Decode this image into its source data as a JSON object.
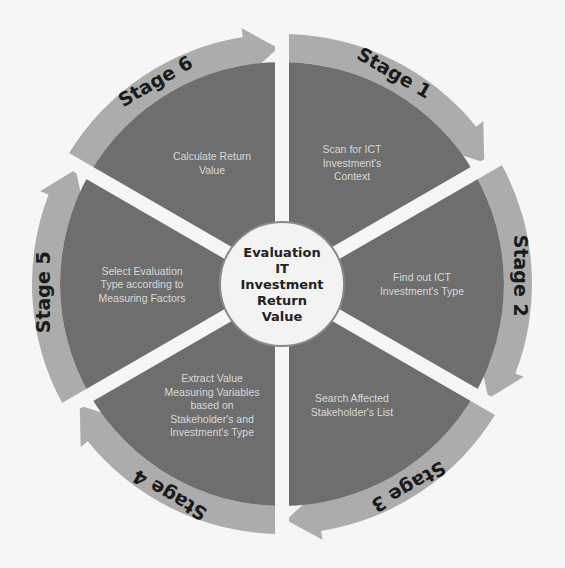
{
  "diagram": {
    "center": {
      "lines": [
        "Evaluation",
        "IT",
        "Investment",
        "Return",
        "Value"
      ]
    },
    "stages": [
      {
        "label": "Stage 1",
        "lines": [
          "Scan for ICT",
          "Investment's",
          "Context"
        ]
      },
      {
        "label": "Stage 2",
        "lines": [
          "Find out ICT",
          "Investment's Type"
        ]
      },
      {
        "label": "Stage 3",
        "lines": [
          "Search Affected",
          "Stakeholder's List"
        ]
      },
      {
        "label": "Stage 4",
        "lines": [
          "Extract Value",
          "Measuring Variables",
          "based on",
          "Stakeholder's and",
          "Investment's Type"
        ]
      },
      {
        "label": "Stage 5",
        "lines": [
          "Select Evaluation",
          "Type according to",
          "Measuring Factors"
        ]
      },
      {
        "label": "Stage 6",
        "lines": [
          "Calculate Return",
          "Value"
        ]
      }
    ],
    "colors": {
      "background": "#f6f6f6",
      "segment": "#6e6e6e",
      "arrow": "#acacac",
      "spoke": "#f6f6f6",
      "center": "#f3f3f3",
      "center_border": "#8a8a8a",
      "segment_text": "#d8d8d8",
      "label_text": "#1a1a1a"
    }
  }
}
